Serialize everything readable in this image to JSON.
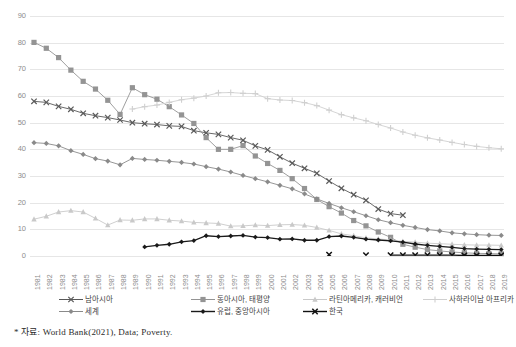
{
  "footnote": "* 자료: World Bank(2021), Data; Poverty.",
  "legend": {
    "items": [
      {
        "label": "남아시아",
        "marker": "x",
        "color": "#595959",
        "row": 0,
        "col": 0
      },
      {
        "label": "동아시아, 태평양",
        "marker": "square",
        "color": "#949494",
        "row": 0,
        "col": 1
      },
      {
        "label": "라틴아메리카, 캐러비언",
        "marker": "triangle",
        "color": "#c9c9c9",
        "row": 0,
        "col": 2
      },
      {
        "label": "사하라이남 아프리카",
        "marker": "plus",
        "color": "#d0d0d0",
        "row": 0,
        "col": 3
      },
      {
        "label": "세계",
        "marker": "diamond",
        "color": "#8a8a8a",
        "row": 1,
        "col": 0
      },
      {
        "label": "유럽, 중앙아시아",
        "marker": "diamond-solid",
        "color": "#1a1a1a",
        "row": 1,
        "col": 1
      },
      {
        "label": "한국",
        "marker": "x-solid",
        "color": "#111111",
        "row": 1,
        "col": 2
      }
    ]
  },
  "chart_data": {
    "type": "line",
    "title": "",
    "xlabel": "",
    "ylabel": "",
    "ylim": [
      0,
      90
    ],
    "ytick_step": 10,
    "yticks": [
      0,
      10,
      20,
      30,
      40,
      50,
      60,
      70,
      80,
      90
    ],
    "grid": true,
    "legend_position": "bottom",
    "x": [
      1981,
      1982,
      1983,
      1984,
      1985,
      1986,
      1987,
      1988,
      1989,
      1990,
      1991,
      1992,
      1993,
      1994,
      1995,
      1996,
      1997,
      1998,
      1999,
      2000,
      2001,
      2002,
      2003,
      2004,
      2005,
      2006,
      2007,
      2008,
      2009,
      2010,
      2011,
      2012,
      2013,
      2014,
      2015,
      2016,
      2017,
      2018,
      2019
    ],
    "series": [
      {
        "name": "남아시아",
        "marker": "x",
        "color": "#595959",
        "values": [
          58.0,
          57.6,
          56.1,
          55.0,
          53.5,
          52.6,
          51.9,
          51.0,
          50.0,
          49.6,
          49.3,
          48.8,
          48.6,
          47.0,
          46.2,
          45.6,
          44.4,
          43.4,
          41.3,
          39.8,
          37.2,
          34.8,
          32.9,
          31.0,
          28.1,
          25.4,
          23.0,
          20.9,
          17.6,
          15.9,
          15.3,
          null,
          null,
          null,
          null,
          null,
          null,
          null,
          null
        ]
      },
      {
        "name": "동아시아, 태평양",
        "marker": "square",
        "color": "#949494",
        "values": [
          80.1,
          77.9,
          74.4,
          69.7,
          65.5,
          62.6,
          58.4,
          53.1,
          63.1,
          60.5,
          58.8,
          56.0,
          52.9,
          49.7,
          44.4,
          40.0,
          40.0,
          41.4,
          37.5,
          34.7,
          32.1,
          29.0,
          25.3,
          21.2,
          18.5,
          16.1,
          13.3,
          11.3,
          9.0,
          7.0,
          4.4,
          3.3,
          2.4,
          1.9,
          1.5,
          1.2,
          1.0,
          0.9,
          0.8
        ]
      },
      {
        "name": "라틴아메리카, 캐러비언",
        "marker": "triangle",
        "color": "#c9c9c9",
        "values": [
          13.8,
          14.9,
          16.5,
          17.0,
          16.5,
          14.1,
          11.6,
          13.5,
          13.4,
          13.9,
          13.9,
          13.4,
          13.1,
          12.6,
          12.4,
          12.2,
          11.2,
          11.3,
          11.6,
          11.4,
          11.7,
          11.8,
          11.5,
          10.7,
          9.6,
          8.3,
          7.6,
          6.8,
          6.4,
          6.0,
          5.5,
          5.2,
          4.8,
          4.6,
          4.4,
          4.2,
          4.1,
          4.1,
          4.0
        ]
      },
      {
        "name": "사하라이남 아프리카",
        "marker": "plus",
        "color": "#d0d0d0",
        "values": [
          null,
          null,
          null,
          null,
          null,
          null,
          null,
          null,
          55.1,
          56.0,
          56.6,
          57.6,
          58.6,
          59.2,
          60.0,
          61.2,
          61.3,
          61.0,
          60.9,
          59.0,
          58.5,
          58.3,
          57.5,
          56.4,
          54.7,
          53.0,
          51.8,
          50.7,
          49.3,
          48.0,
          46.5,
          45.3,
          44.3,
          43.5,
          42.6,
          41.8,
          41.1,
          40.6,
          40.2
        ]
      },
      {
        "name": "세계",
        "marker": "diamond",
        "color": "#8a8a8a",
        "values": [
          42.5,
          42.2,
          41.3,
          39.5,
          38.1,
          36.5,
          35.6,
          34.2,
          36.6,
          36.2,
          35.9,
          35.5,
          35.1,
          34.5,
          33.5,
          32.6,
          31.5,
          30.2,
          29.0,
          27.8,
          26.5,
          25.2,
          23.3,
          21.4,
          19.7,
          18.1,
          16.6,
          15.1,
          13.6,
          12.5,
          11.5,
          10.7,
          9.9,
          9.4,
          8.7,
          8.3,
          8.0,
          7.8,
          7.7
        ]
      },
      {
        "name": "유럽, 중앙아시아",
        "marker": "diamond-solid",
        "color": "#1a1a1a",
        "values": [
          null,
          null,
          null,
          null,
          null,
          null,
          null,
          null,
          null,
          3.4,
          4.0,
          4.4,
          5.3,
          5.8,
          7.6,
          7.3,
          7.5,
          7.7,
          7.1,
          6.9,
          6.3,
          6.4,
          5.9,
          5.9,
          7.3,
          7.5,
          7.0,
          6.3,
          6.0,
          5.7,
          5.2,
          4.5,
          4.0,
          3.6,
          3.2,
          2.8,
          2.6,
          2.5,
          2.4
        ]
      },
      {
        "name": "한국",
        "marker": "x-solid",
        "color": "#111111",
        "values": [
          null,
          null,
          null,
          null,
          null,
          null,
          null,
          null,
          null,
          null,
          null,
          null,
          null,
          null,
          null,
          null,
          null,
          null,
          null,
          null,
          null,
          null,
          null,
          null,
          0.5,
          null,
          null,
          0.3,
          null,
          0.3,
          0.3,
          0.3,
          0.3,
          0.3,
          0.3,
          0.2,
          0.2,
          0.2,
          0.2
        ]
      }
    ]
  }
}
